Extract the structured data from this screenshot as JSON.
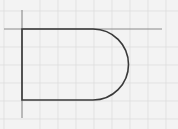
{
  "diagram": {
    "background_color": "#f3f3f3",
    "grid_color": "#d8d8d8",
    "axis_color": "#8a8a8a",
    "shape_stroke_color": "#3a3a3a",
    "grid_spacing_px": 18
  }
}
